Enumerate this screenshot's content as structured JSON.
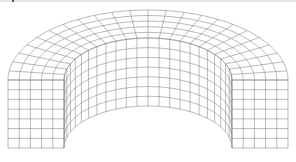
{
  "figure": {
    "type": "wireframe-mesh",
    "shape": "half-annulus-solid",
    "line_color": "#8a8a8a",
    "background": "#ffffff",
    "center": [
      148,
      80
    ],
    "outer_rx": 140,
    "outer_ry": 70,
    "inner_rx": 84,
    "inner_ry": 42,
    "height": 68,
    "angular_divisions": 24,
    "radial_divisions": 5,
    "height_divisions": 7
  }
}
